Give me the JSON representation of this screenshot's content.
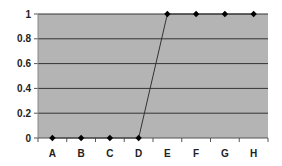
{
  "chart_data": {
    "type": "line",
    "title": "",
    "xlabel": "",
    "ylabel": "",
    "categories": [
      "A",
      "B",
      "C",
      "D",
      "E",
      "F",
      "G",
      "H"
    ],
    "series": [
      {
        "name": "Series 1",
        "values": [
          0,
          0,
          0,
          0,
          1,
          1,
          1,
          1
        ]
      }
    ],
    "ylim": [
      0,
      1
    ],
    "yticks": [
      "0",
      "0.2",
      "0.4",
      "0.6",
      "0.8",
      "1"
    ],
    "grid": true,
    "legend": "none",
    "colors": {
      "plot_bg": "#b4b4b4",
      "grid": "#333333",
      "line": "#333333",
      "marker": "#000000"
    }
  }
}
